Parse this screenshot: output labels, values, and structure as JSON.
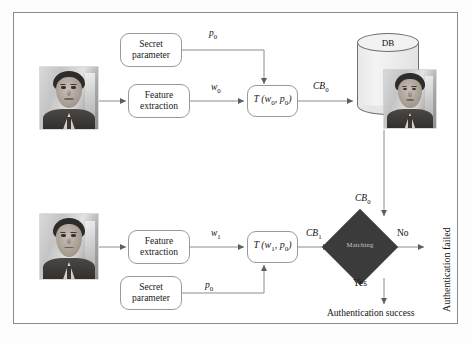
{
  "figure": {
    "frame_border_color": "#8a8a8a",
    "background": "#ffffff"
  },
  "enrollment": {
    "section_name": "enrollment",
    "photo_alt": "face-photo-enrollment",
    "secret_parameter": {
      "line1": "Secret",
      "line2": "parameter"
    },
    "feature_extraction": {
      "line1": "Feature",
      "line2": "extraction"
    },
    "transform_box": {
      "fn": "T",
      "args": "(w",
      "sub1": "0",
      "sep": ", p",
      "sub2": "0",
      "close": ")",
      "full": "T (w0, p0)"
    },
    "labels": {
      "p0": "p",
      "p0_sub": "0",
      "w0": "w",
      "w0_sub": "0",
      "cb0": "CB",
      "cb0_sub": "0"
    },
    "database": {
      "label": "DB",
      "stored_template_alt": "stored-face-template"
    }
  },
  "verification": {
    "section_name": "verification",
    "photo_alt": "face-photo-probe",
    "secret_parameter": {
      "line1": "Secret",
      "line2": "parameter"
    },
    "feature_extraction": {
      "line1": "Feature",
      "line2": "extraction"
    },
    "transform_box": {
      "full": "T (w1, p0)"
    },
    "labels": {
      "p0": "p",
      "p0_sub": "0",
      "w1": "w",
      "w1_sub": "1",
      "cb1": "CB",
      "cb1_sub": "1",
      "cb0_from_db": "CB",
      "cb0_from_db_sub": "0"
    },
    "matching": {
      "label": "Matching",
      "fill_color": "#3b3b3b",
      "text_color": "#c9c9c9"
    },
    "decisions": {
      "no_label": "No",
      "yes_label": "Yes",
      "failed_text": "Authentication failed",
      "success_text": "Authentication success"
    }
  }
}
